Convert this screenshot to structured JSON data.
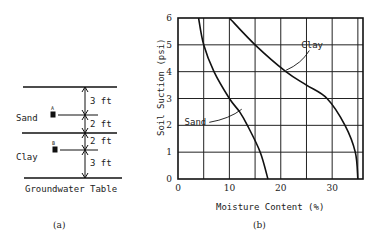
{
  "panel_a": {
    "caption": "(a)",
    "layers": [
      {
        "name": "Sand",
        "point": "A"
      },
      {
        "name": "Clay",
        "point": "B"
      }
    ],
    "dimensions": [
      "3 ft",
      "2 ft",
      "2 ft",
      "3 ft"
    ],
    "groundwater_label": "Groundwater Table"
  },
  "panel_b": {
    "caption": "(b)"
  },
  "chart_data": {
    "type": "line",
    "title": "",
    "xlabel": "Moisture Content (%)",
    "ylabel": "Soil Suction (psi)",
    "xlim": [
      0,
      36
    ],
    "ylim": [
      0,
      6
    ],
    "xticks": [
      0,
      10,
      20,
      30
    ],
    "yticks": [
      0,
      1,
      2,
      3,
      4,
      5,
      6
    ],
    "x_grid": [
      5,
      10,
      15,
      20,
      25,
      30,
      35
    ],
    "y_grid": [
      1,
      2,
      3,
      4,
      5
    ],
    "grid": true,
    "series": [
      {
        "name": "Sand",
        "x": [
          4.0,
          5.0,
          7.0,
          10.0,
          12.0,
          13.5,
          16.0,
          17.5
        ],
        "y": [
          6.0,
          5.0,
          4.0,
          3.0,
          2.5,
          2.0,
          1.0,
          0.0
        ],
        "label_at": [
          5.5,
          2.0
        ],
        "leader_to": [
          12.4,
          2.6
        ]
      },
      {
        "name": "Clay",
        "x": [
          10.0,
          15.0,
          21.0,
          25.0,
          29.0,
          32.5,
          34.5,
          35.0
        ],
        "y": [
          6.0,
          5.0,
          4.0,
          3.5,
          3.0,
          2.0,
          1.0,
          0.0
        ],
        "label_at": [
          24.0,
          4.9
        ],
        "leader_to": [
          21.0,
          4.05
        ]
      }
    ]
  }
}
